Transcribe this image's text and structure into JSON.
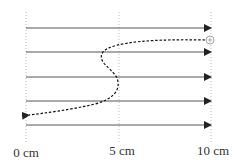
{
  "diagram": {
    "type": "charged-particle-in-uniform-field",
    "field_lines": {
      "count": 5,
      "direction": "right",
      "color": "#555555",
      "y_positions": [
        28,
        52,
        77,
        101,
        125
      ]
    },
    "reference_lines": [
      {
        "x": 26,
        "label": "0 cm"
      },
      {
        "x": 119,
        "label": "5 cm"
      },
      {
        "x": 211,
        "label": "10 cm"
      }
    ],
    "particle": {
      "symbol": "+",
      "charge": "positive",
      "start": {
        "x": 211,
        "y": 40
      },
      "color": "#999999"
    },
    "trajectory": {
      "style": "dashed",
      "color": "#111111",
      "end_arrow": "left",
      "end": {
        "x": 26,
        "y": 115
      }
    },
    "axis_labels": [
      "0 cm",
      "5 cm",
      "10 cm"
    ]
  }
}
